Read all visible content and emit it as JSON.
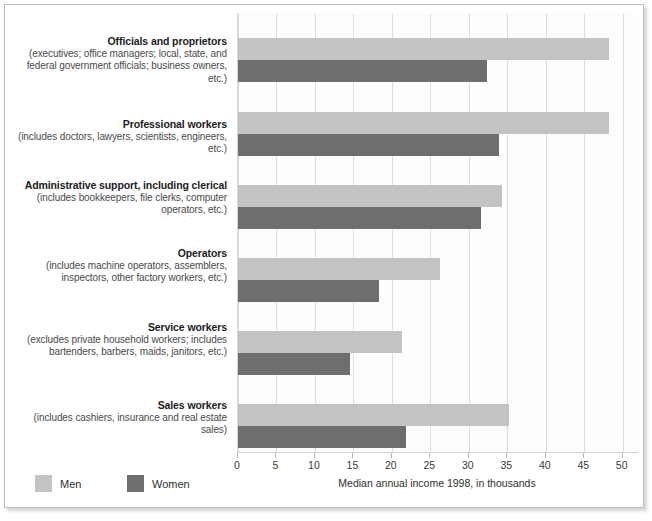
{
  "chart_data": {
    "type": "bar",
    "orientation": "horizontal",
    "title": "",
    "xlabel": "Median annual income 1998, in thousands",
    "ylabel": "",
    "xlim": [
      0,
      52
    ],
    "xticks": [
      0,
      5,
      10,
      15,
      20,
      25,
      30,
      35,
      40,
      45,
      50
    ],
    "xtick_labels": [
      "0",
      "5",
      "10",
      "15",
      "20",
      "25",
      "30",
      "35",
      "40",
      "45",
      "50"
    ],
    "grid": true,
    "legend_position": "bottom-left",
    "categories": [
      "Officials and proprietors",
      "Professional workers",
      "Administrative support, including clerical",
      "Operators",
      "Service workers",
      "Sales workers"
    ],
    "series": [
      {
        "name": "Men",
        "color": "#c3c3c3",
        "values": [
          48.2,
          48.2,
          34.3,
          26.2,
          21.3,
          35.2
        ]
      },
      {
        "name": "Women",
        "color": "#6e6e6e",
        "values": [
          32.4,
          33.9,
          31.6,
          18.3,
          14.6,
          21.8
        ]
      }
    ]
  },
  "categories": [
    {
      "title": "Officials and proprietors",
      "sub": "(executives; office managers; local, state, and federal government officials; business owners, etc.)"
    },
    {
      "title": "Professional workers",
      "sub": "(includes doctors, lawyers, scientists, engineers, etc.)"
    },
    {
      "title": "Administrative support, including clerical",
      "sub": "(includes bookkeepers, file clerks, computer operators, etc.)"
    },
    {
      "title": "Operators",
      "sub": "(includes machine operators, assemblers, inspectors, other factory workers, etc.)"
    },
    {
      "title": "Service workers",
      "sub": "(excludes private household workers; includes bartenders, barbers, maids, janitors, etc.)"
    },
    {
      "title": "Sales workers",
      "sub": "(includes cashiers, insurance and real estate sales)"
    }
  ],
  "legend": {
    "men_label": "Men",
    "women_label": "Women"
  },
  "axis": {
    "title": "Median annual income 1998, in thousands"
  }
}
